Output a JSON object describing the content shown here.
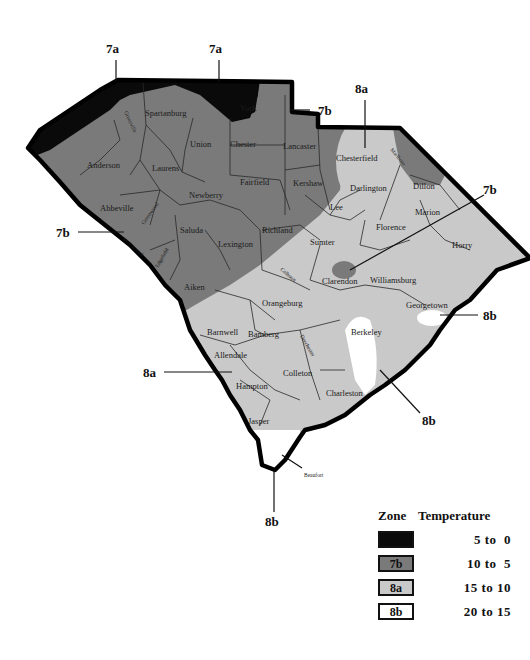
{
  "map": {
    "title": "South Carolina Hardiness Zones",
    "colors": {
      "zone_7a": "#0a0a0a",
      "zone_7b": "#7a7a7a",
      "zone_8a": "#c9c9c9",
      "zone_8b": "#ffffff",
      "border": "#000000"
    },
    "callouts": [
      {
        "label": "7a"
      },
      {
        "label": "7a"
      },
      {
        "label": "7b"
      },
      {
        "label": "8a"
      },
      {
        "label": "7b"
      },
      {
        "label": "7b"
      },
      {
        "label": "8b"
      },
      {
        "label": "8a"
      },
      {
        "label": "8b"
      },
      {
        "label": "8b"
      }
    ],
    "counties": [
      {
        "name": "Spartanburg"
      },
      {
        "name": "York"
      },
      {
        "name": "Union"
      },
      {
        "name": "Chester"
      },
      {
        "name": "Lancaster"
      },
      {
        "name": "Chesterfield"
      },
      {
        "name": "Marlboro"
      },
      {
        "name": "Anderson"
      },
      {
        "name": "Laurens"
      },
      {
        "name": "Greenville"
      },
      {
        "name": "Newberry"
      },
      {
        "name": "Fairfield"
      },
      {
        "name": "Kershaw"
      },
      {
        "name": "Darlington"
      },
      {
        "name": "Dillon"
      },
      {
        "name": "Lee"
      },
      {
        "name": "Abbeville"
      },
      {
        "name": "Greenwood"
      },
      {
        "name": "Saluda"
      },
      {
        "name": "McCormick"
      },
      {
        "name": "Edgefield"
      },
      {
        "name": "Lexington"
      },
      {
        "name": "Richland"
      },
      {
        "name": "Sumter"
      },
      {
        "name": "Florence"
      },
      {
        "name": "Marion"
      },
      {
        "name": "Horry"
      },
      {
        "name": "Aiken"
      },
      {
        "name": "Calhoun"
      },
      {
        "name": "Clarendon"
      },
      {
        "name": "Williamsburg"
      },
      {
        "name": "Orangeburg"
      },
      {
        "name": "Georgetown"
      },
      {
        "name": "Barnwell"
      },
      {
        "name": "Bamberg"
      },
      {
        "name": "Dorchester"
      },
      {
        "name": "Berkeley"
      },
      {
        "name": "Allendale"
      },
      {
        "name": "Hampton"
      },
      {
        "name": "Colleton"
      },
      {
        "name": "Charleston"
      },
      {
        "name": "Jasper"
      },
      {
        "name": "Beaufort"
      }
    ]
  },
  "legend": {
    "header_zone": "Zone",
    "header_temp": "Temperature",
    "rows": [
      {
        "zone": "",
        "temp": "5 to  0",
        "color": "#0a0a0a"
      },
      {
        "zone": "7b",
        "temp": "10 to  5",
        "color": "#7a7a7a"
      },
      {
        "zone": "8a",
        "temp": "15 to 10",
        "color": "#c9c9c9"
      },
      {
        "zone": "8b",
        "temp": "20 to 15",
        "color": "#ffffff"
      }
    ]
  }
}
